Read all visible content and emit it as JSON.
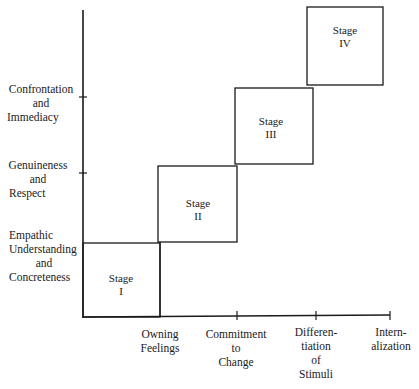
{
  "diagram": {
    "type": "staircase-stage-diagram",
    "y_axis": {
      "labels": [
        {
          "lines": [
            "Confrontation",
            "and",
            "Immediacy"
          ]
        },
        {
          "lines": [
            "Genuineness",
            "and",
            "Respect"
          ]
        },
        {
          "lines": [
            "Empathic",
            "Understanding",
            "and",
            "Concreteness"
          ]
        }
      ]
    },
    "x_axis": {
      "labels": [
        {
          "lines": [
            "Owning",
            "Feelings"
          ]
        },
        {
          "lines": [
            "Commitment",
            "to",
            "Change"
          ]
        },
        {
          "lines": [
            "Differen-",
            "tiation",
            "of",
            "Stimuli"
          ]
        },
        {
          "lines": [
            "Intern-",
            "alization"
          ]
        }
      ]
    },
    "stages": [
      {
        "word": "Stage",
        "numeral": "I"
      },
      {
        "word": "Stage",
        "numeral": "II"
      },
      {
        "word": "Stage",
        "numeral": "III"
      },
      {
        "word": "Stage",
        "numeral": "IV"
      }
    ],
    "line_color": "#1a1a1a"
  }
}
